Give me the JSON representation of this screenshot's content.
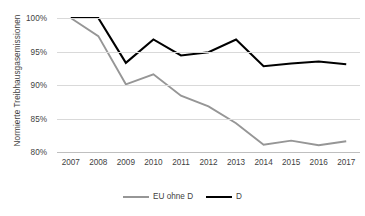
{
  "chart_data": {
    "type": "line",
    "title": "",
    "xlabel": "",
    "ylabel": "Normierte Treibhausgasemissionen",
    "categories": [
      "2007",
      "2008",
      "2009",
      "2010",
      "2011",
      "2012",
      "2013",
      "2014",
      "2015",
      "2016",
      "2017"
    ],
    "series": [
      {
        "name": "EU ohne D",
        "color": "#969696",
        "values": [
          100.0,
          97.3,
          90.1,
          91.6,
          88.4,
          86.8,
          84.3,
          81.1,
          81.7,
          81.0,
          81.6
        ]
      },
      {
        "name": "D",
        "color": "#000000",
        "values": [
          100.0,
          100.0,
          93.3,
          96.8,
          94.4,
          94.9,
          96.8,
          92.8,
          93.2,
          93.5,
          93.1
        ]
      }
    ],
    "ylim": [
      80,
      100
    ],
    "yticks": [
      100,
      95,
      90,
      85,
      80
    ],
    "ytick_labels": [
      "100%",
      "95%",
      "90%",
      "85%",
      "80%"
    ],
    "grid": true,
    "grid_color": "#d9d9d9",
    "legend_position": "bottom"
  }
}
